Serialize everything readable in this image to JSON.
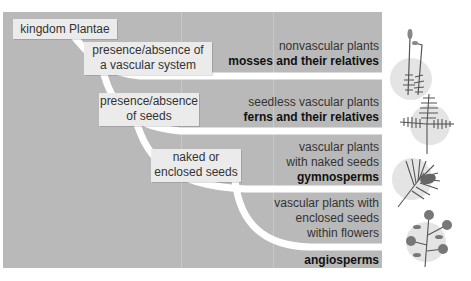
{
  "diagram": {
    "root": "kingdom Plantae",
    "decisions": [
      {
        "line1": "presence/absence of",
        "line2": "a vascular system"
      },
      {
        "line1": "presence/absence",
        "line2": "of seeds"
      },
      {
        "line1": "naked or",
        "line2": "enclosed seeds"
      }
    ],
    "groups": [
      {
        "lines": [
          "nonvascular plants"
        ],
        "name": "mosses and their relatives",
        "icon": "moss-icon"
      },
      {
        "lines": [
          "seedless vascular plants"
        ],
        "name": "ferns and their relatives",
        "icon": "fern-icon"
      },
      {
        "lines": [
          "vascular plants",
          "with naked seeds"
        ],
        "name": "gymnosperms",
        "icon": "pine-branch-icon"
      },
      {
        "lines": [
          "vascular plants with",
          "enclosed seeds",
          "within flowers"
        ],
        "name": "angiosperms",
        "icon": "flowering-plant-icon"
      }
    ],
    "colors": {
      "panel": "#b9b9b9",
      "label_box": "#ebebeb",
      "branch": "#ffffff",
      "icon_circle": "#e4e4e4"
    }
  }
}
